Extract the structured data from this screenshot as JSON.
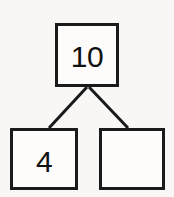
{
  "diagram": {
    "kind": "number-bond",
    "colors": {
      "background": "#f8f7f5",
      "stroke": "#1a1a1a",
      "box_fill": "#fdfcfb",
      "text": "#111111"
    },
    "whole": {
      "label": "10",
      "role": "whole",
      "box": {
        "x": 55,
        "y": 23,
        "w": 64,
        "h": 64
      }
    },
    "parts": [
      {
        "label": "4",
        "role": "part-known",
        "box": {
          "x": 10,
          "y": 128,
          "w": 68,
          "h": 62
        }
      },
      {
        "label": "",
        "role": "part-missing",
        "box": {
          "x": 99,
          "y": 128,
          "w": 66,
          "h": 62
        }
      }
    ],
    "connectors": [
      {
        "name": "whole-to-left-part",
        "x1": 87,
        "y1": 87,
        "x2": 49,
        "y2": 128
      },
      {
        "name": "whole-to-right-part",
        "x1": 89,
        "y1": 87,
        "x2": 128,
        "y2": 128
      }
    ]
  }
}
